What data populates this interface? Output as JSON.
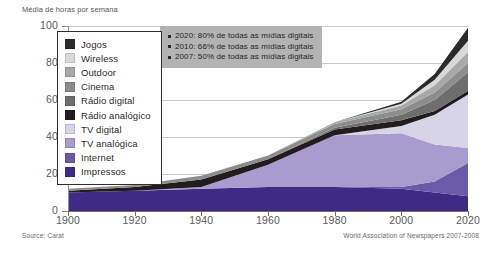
{
  "axis_title": "Média de horas por semana",
  "source_note": "Source: Carat",
  "attribution": "World Association of Newspapers 2007-2008",
  "legend": {
    "items": [
      {
        "label": "Jogos",
        "color": "#2b2b2b"
      },
      {
        "label": "Wireless",
        "color": "#d9d9d9"
      },
      {
        "label": "Outdoor",
        "color": "#a8a8a8"
      },
      {
        "label": "Cinema",
        "color": "#8d8d8d"
      },
      {
        "label": "Rádio digital",
        "color": "#6e6e6e"
      },
      {
        "label": "Rádio analógico",
        "color": "#241c1c"
      },
      {
        "label": "TV digital",
        "color": "#d8d4e8"
      },
      {
        "label": "TV analógica",
        "color": "#a89cce"
      },
      {
        "label": "Internet",
        "color": "#6a5aa8"
      },
      {
        "label": "Impressos",
        "color": "#3f2a86"
      }
    ]
  },
  "callout": {
    "lines": [
      "2020: 80% de todas as mídias digitais",
      "2010: 66% de todas as mídias digitais",
      "2007: 50% de todas as mídias digitais"
    ]
  },
  "chart_data": {
    "type": "area",
    "stacked": true,
    "title": "Média de horas por semana",
    "xlabel": "",
    "ylabel": "Média de horas por semana",
    "xlim": [
      1900,
      2020
    ],
    "ylim": [
      0,
      100
    ],
    "xticks": [
      1900,
      1920,
      1940,
      1960,
      1980,
      2000,
      2020
    ],
    "yticks": [
      0,
      20,
      40,
      60,
      80,
      100
    ],
    "grid": true,
    "legend_position": "upper-left",
    "x": [
      1900,
      1920,
      1940,
      1960,
      1980,
      2000,
      2010,
      2020
    ],
    "series": [
      {
        "name": "Impressos",
        "color": "#3f2a86",
        "values": [
          10,
          11,
          12,
          13,
          13,
          12,
          10,
          8
        ]
      },
      {
        "name": "Internet",
        "color": "#6a5aa8",
        "values": [
          0,
          0,
          0,
          0,
          0,
          1,
          6,
          18
        ]
      },
      {
        "name": "TV analógica",
        "color": "#a89cce",
        "values": [
          0,
          0,
          1,
          12,
          28,
          29,
          20,
          8
        ]
      },
      {
        "name": "TV digital",
        "color": "#d8d4e8",
        "values": [
          0,
          0,
          0,
          0,
          0,
          4,
          16,
          29
        ]
      },
      {
        "name": "Rádio analógico",
        "color": "#241c1c",
        "values": [
          1,
          2,
          4,
          3,
          3,
          3,
          2,
          2
        ]
      },
      {
        "name": "Rádio digital",
        "color": "#6e6e6e",
        "values": [
          0,
          0,
          0,
          0,
          1,
          3,
          6,
          10
        ]
      },
      {
        "name": "Cinema",
        "color": "#8d8d8d",
        "values": [
          1,
          1,
          2,
          2,
          2,
          3,
          4,
          5
        ]
      },
      {
        "name": "Outdoor",
        "color": "#a8a8a8",
        "values": [
          0,
          0,
          0,
          0,
          1,
          2,
          4,
          6
        ]
      },
      {
        "name": "Wireless",
        "color": "#d9d9d9",
        "values": [
          0,
          0,
          0,
          0,
          0,
          1,
          3,
          6
        ]
      },
      {
        "name": "Jogos",
        "color": "#2b2b2b",
        "values": [
          0,
          0,
          0,
          0,
          0,
          1,
          3,
          7
        ]
      }
    ]
  }
}
